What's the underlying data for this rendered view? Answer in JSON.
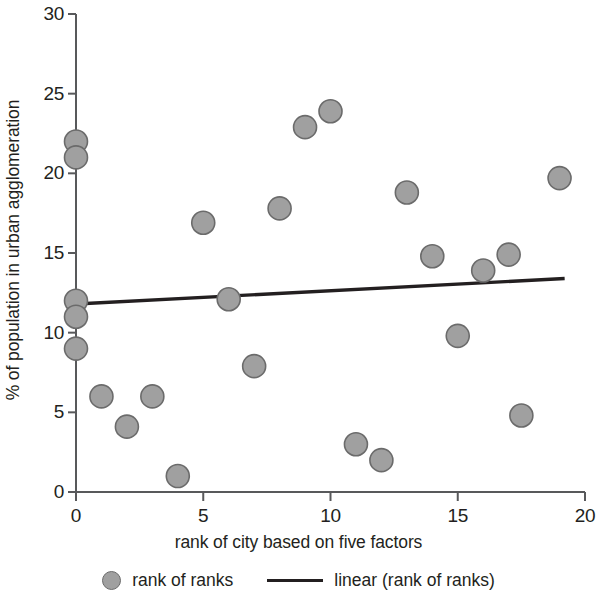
{
  "chart_data": {
    "type": "scatter",
    "title": "",
    "xlabel": "rank of city based on five factors",
    "ylabel": "% of population in urban agglomeration",
    "xlim": [
      0,
      20
    ],
    "ylim": [
      0,
      30
    ],
    "xticks": [
      0,
      5,
      10,
      15,
      20
    ],
    "yticks": [
      0,
      5,
      10,
      15,
      20,
      25,
      30
    ],
    "xtick_labels": [
      "0",
      "5",
      "10",
      "15",
      "20"
    ],
    "ytick_labels": [
      "0",
      "5",
      "10",
      "15",
      "20",
      "25",
      "30"
    ],
    "grid": false,
    "legend_position": "below",
    "marker_color": "#a0a0a0",
    "marker_edge_color": "#6b6b6b",
    "line_color": "#231f20",
    "axis_color": "#58595b",
    "series": [
      {
        "name": "rank of ranks",
        "type": "scatter",
        "points": [
          {
            "x": 0,
            "y": 22.0
          },
          {
            "x": 0,
            "y": 21.0
          },
          {
            "x": 0,
            "y": 12.0
          },
          {
            "x": 0,
            "y": 11.0
          },
          {
            "x": 0,
            "y": 9.0
          },
          {
            "x": 1,
            "y": 6.0
          },
          {
            "x": 2,
            "y": 4.1
          },
          {
            "x": 3,
            "y": 6.0
          },
          {
            "x": 4,
            "y": 1.0
          },
          {
            "x": 5,
            "y": 16.9
          },
          {
            "x": 6,
            "y": 12.1
          },
          {
            "x": 7,
            "y": 7.9
          },
          {
            "x": 8,
            "y": 17.8
          },
          {
            "x": 9,
            "y": 22.9
          },
          {
            "x": 10,
            "y": 23.9
          },
          {
            "x": 11,
            "y": 3.0
          },
          {
            "x": 12,
            "y": 2.0
          },
          {
            "x": 13,
            "y": 18.8
          },
          {
            "x": 14,
            "y": 14.8
          },
          {
            "x": 15,
            "y": 9.8
          },
          {
            "x": 16,
            "y": 13.9
          },
          {
            "x": 17,
            "y": 14.9
          },
          {
            "x": 17.5,
            "y": 4.8
          },
          {
            "x": 19,
            "y": 19.7
          }
        ]
      },
      {
        "name": "linear (rank of ranks)",
        "type": "line",
        "x0": 0,
        "y0": 11.8,
        "x1": 19.2,
        "y1": 13.4
      }
    ],
    "legend": [
      {
        "label": "rank of ranks",
        "marker": "circle"
      },
      {
        "label": "linear (rank of ranks)",
        "marker": "line"
      }
    ]
  }
}
